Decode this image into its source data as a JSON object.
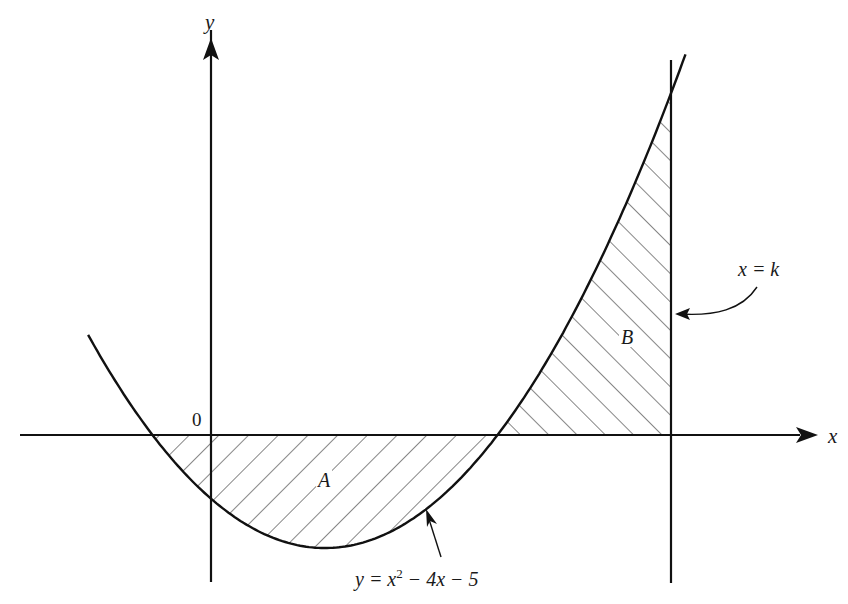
{
  "figure": {
    "axes": {
      "x_label": "x",
      "y_label": "y",
      "origin_label": "0"
    },
    "curve": {
      "equation_prefix": "y = x",
      "equation_exponent": "2",
      "equation_suffix": " − 4x − 5",
      "color": "#111111"
    },
    "vertical_line": {
      "label": "x = k"
    },
    "regions": {
      "A": {
        "label": "A",
        "description": "region between curve and x-axis from x=-1 to x=5 (below axis)"
      },
      "B": {
        "label": "B",
        "description": "region between curve and x-axis from x=5 to x=k (above axis)"
      }
    },
    "colors": {
      "background": "#ffffff",
      "ink": "#111111"
    }
  },
  "chart_data": {
    "type": "line",
    "title": "",
    "xlabel": "x",
    "ylabel": "y",
    "function": "y = x^2 - 4x - 5",
    "roots": [
      -1,
      5
    ],
    "vertex": [
      2,
      -9
    ],
    "y_intercept": -5,
    "vertical_line_x": "k",
    "shaded_regions": [
      {
        "label": "A",
        "x_from": -1,
        "x_to": 5,
        "side": "below x-axis"
      },
      {
        "label": "B",
        "x_from": 5,
        "x_to": "k",
        "side": "above x-axis"
      }
    ],
    "grid": false,
    "legend": null
  }
}
